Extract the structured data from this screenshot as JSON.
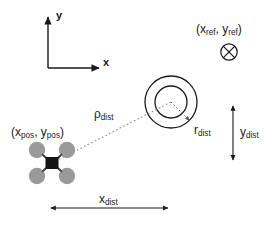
{
  "diagram": {
    "colors": {
      "stroke": "#1a1a1a",
      "rotor_fill": "#9a9a9a",
      "body_fill": "#141414",
      "dotted": "#8c8c8c",
      "background": "#ffffff"
    },
    "axes": {
      "y_label": "y",
      "x_label": "x"
    },
    "reference_point": {
      "label_prefix": "(x",
      "label_sub1": "ref",
      "label_mid": ", y",
      "label_sub2": "ref",
      "label_suffix": ")",
      "label_text": "(xref, yref)",
      "marker": "circled-x-icon"
    },
    "drone": {
      "label_prefix": "(x",
      "label_sub1": "pos",
      "label_mid": ", y",
      "label_sub2": "pos",
      "label_suffix": ")",
      "label_text": "(xpos, ypos)",
      "icon": "quadrotor-icon"
    },
    "target": {
      "icon": "concentric-circles-icon",
      "radius_label_main": "r",
      "radius_label_sub": "dist"
    },
    "measures": {
      "rho": {
        "main": "ρ",
        "sub": "dist"
      },
      "x_dist": {
        "main": "x",
        "sub": "dist"
      },
      "y_dist": {
        "main": "y",
        "sub": "dist"
      }
    }
  }
}
